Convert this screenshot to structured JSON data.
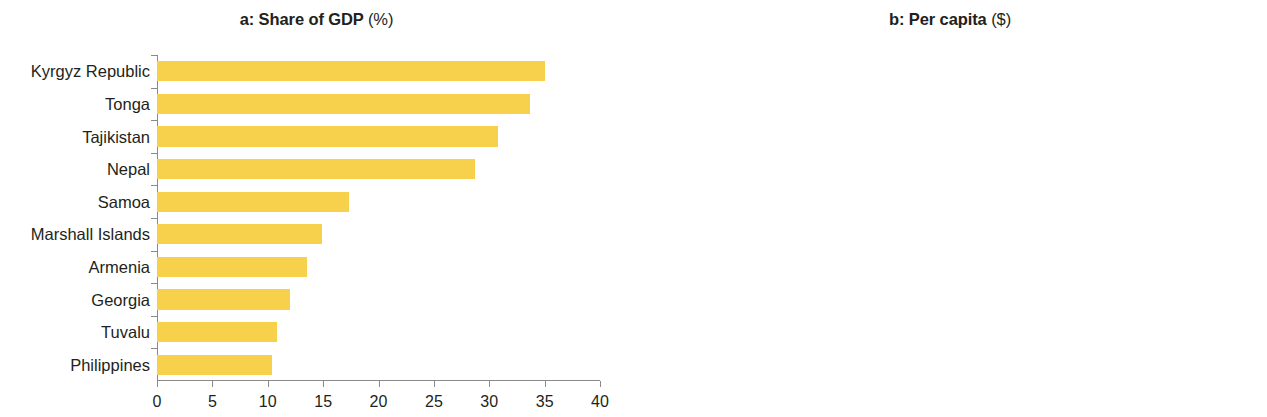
{
  "figure": {
    "background": "#ffffff"
  },
  "chart_data": [
    {
      "type": "bar",
      "orientation": "horizontal",
      "panel": "a",
      "title": "a: Share of GDP",
      "title_prefix": "a: Share of GDP",
      "title_unit": "(%)",
      "xlabel": "",
      "ylabel": "",
      "xlim": [
        0,
        40
      ],
      "xticks": [
        0,
        5,
        10,
        15,
        20,
        25,
        30,
        35,
        40
      ],
      "xticklabels": [
        "0",
        "5",
        "10",
        "15",
        "20",
        "25",
        "30",
        "35",
        "40"
      ],
      "grid": false,
      "legend": "none",
      "color": "#f8d14c",
      "categories": [
        "Kyrgyz Republic",
        "Tonga",
        "Tajikistan",
        "Nepal",
        "Samoa",
        "Marshall Islands",
        "Armenia",
        "Georgia",
        "Tuvalu",
        "Philippines"
      ],
      "values": [
        35.0,
        33.7,
        30.8,
        28.7,
        17.3,
        14.9,
        13.5,
        12.0,
        10.8,
        10.4
      ]
    },
    {
      "type": "bar",
      "orientation": "horizontal",
      "panel": "b",
      "title": "b: Per capita",
      "title_prefix": "b: Per capita",
      "title_unit": "($)",
      "xlabel": "",
      "ylabel": "",
      "xlim": [
        0,
        1500
      ],
      "xticks": [
        0,
        300,
        600,
        900,
        1200,
        1500
      ],
      "xticklabels": [
        "0",
        "300",
        "600",
        "900",
        "1.200",
        "1.500"
      ],
      "grid": false,
      "legend": "none",
      "color": "#f97b52",
      "categories": [
        "Tonga",
        "Samoa",
        "Marshall Islands",
        "Armenia",
        "Georgia",
        "Kyrgyz Republic",
        "Tuvalu",
        "Sri Lanka",
        "Philippines",
        "Tajikistan"
      ],
      "values": [
        1365,
        729,
        569,
        537,
        469,
        423,
        395,
        352,
        320,
        256
      ]
    }
  ]
}
